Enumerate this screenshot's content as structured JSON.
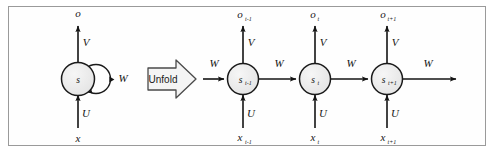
{
  "figure": {
    "border_color": "#9a9a9a",
    "background": "#fefefe",
    "node_fill": "#ececec",
    "node_stroke": "#1a1a1a",
    "arrow_color": "#141414"
  },
  "folded": {
    "node_label": "s",
    "output_label": "o",
    "input_label": "x",
    "weight_output": "V",
    "weight_input": "U",
    "weight_recurrent": "W"
  },
  "unfold": {
    "label": "Unfold"
  },
  "unfolded": {
    "incoming_weight": "W",
    "outgoing_weight": "W",
    "steps": [
      {
        "node_base": "s",
        "node_sub": "t-1",
        "output_base": "o",
        "output_sub": "t-1",
        "input_base": "x",
        "input_sub": "t-1",
        "weight_output": "V",
        "weight_input": "U",
        "weight_recurrent": "W"
      },
      {
        "node_base": "s",
        "node_sub": "t",
        "output_base": "o",
        "output_sub": "t",
        "input_base": "x",
        "input_sub": "t",
        "weight_output": "V",
        "weight_input": "U",
        "weight_recurrent": "W"
      },
      {
        "node_base": "s",
        "node_sub": "t+1",
        "output_base": "o",
        "output_sub": "t+1",
        "input_base": "x",
        "input_sub": "t+1",
        "weight_output": "V",
        "weight_input": "U",
        "weight_recurrent": "W"
      }
    ]
  }
}
